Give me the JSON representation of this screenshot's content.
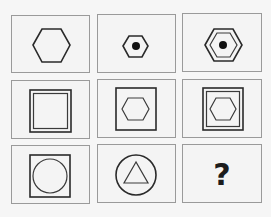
{
  "puzzle": {
    "title": "",
    "grid": {
      "rows": 3,
      "cols": 3
    },
    "cells": [
      {
        "row": 1,
        "col": 1,
        "description": "single large hexagon"
      },
      {
        "row": 1,
        "col": 2,
        "description": "small hexagon with black dot"
      },
      {
        "row": 1,
        "col": 3,
        "description": "double hexagon with black dot"
      },
      {
        "row": 2,
        "col": 1,
        "description": "double square"
      },
      {
        "row": 2,
        "col": 2,
        "description": "square containing hexagon"
      },
      {
        "row": 2,
        "col": 3,
        "description": "double square containing hexagon"
      },
      {
        "row": 3,
        "col": 1,
        "description": "square containing circle"
      },
      {
        "row": 3,
        "col": 2,
        "description": "circle containing triangle"
      },
      {
        "row": 3,
        "col": 3,
        "description": "unknown",
        "label": "?"
      }
    ],
    "colors": {
      "border": "#9a9a9a",
      "stroke": "#2a2a2a",
      "background": "#f4f4f4"
    }
  }
}
